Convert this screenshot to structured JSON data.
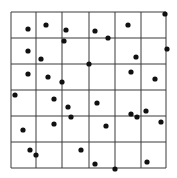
{
  "figure": {
    "grid": {
      "x_lines": [
        11,
        36,
        62,
        89,
        115,
        141,
        166
      ],
      "y_lines": [
        12,
        38,
        64,
        90,
        116,
        142,
        168
      ],
      "line_color": "#3a3a3a"
    },
    "point_color": "#111111",
    "point_radius": 2.6,
    "points": [
      [
        165,
        14
      ],
      [
        28,
        29
      ],
      [
        46,
        25
      ],
      [
        66,
        30
      ],
      [
        64,
        41
      ],
      [
        28,
        51
      ],
      [
        41,
        59
      ],
      [
        89,
        64
      ],
      [
        28,
        74
      ],
      [
        48,
        77
      ],
      [
        62,
        82
      ],
      [
        128,
        25
      ],
      [
        95,
        31
      ],
      [
        108,
        38
      ],
      [
        167,
        49
      ],
      [
        136,
        57
      ],
      [
        131,
        72
      ],
      [
        155,
        79
      ],
      [
        15,
        95
      ],
      [
        54,
        99
      ],
      [
        68,
        107
      ],
      [
        71,
        117
      ],
      [
        54,
        124
      ],
      [
        23,
        130
      ],
      [
        97,
        103
      ],
      [
        131,
        114
      ],
      [
        137,
        117
      ],
      [
        146,
        111
      ],
      [
        161,
        122
      ],
      [
        106,
        126
      ],
      [
        30,
        150
      ],
      [
        36,
        155
      ],
      [
        81,
        150
      ],
      [
        95,
        164
      ],
      [
        115,
        169
      ],
      [
        147,
        162
      ]
    ]
  }
}
